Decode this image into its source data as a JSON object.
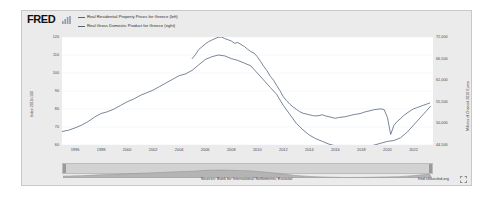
{
  "brand": {
    "logo_text": "FRED",
    "spark_icon": "sparkline-icon"
  },
  "legend": {
    "items": [
      {
        "label": "Real Residential Property Prices for Greece (left)",
        "color": "#5b6b84",
        "swatch_icon": "legend-line-swatch"
      },
      {
        "label": "Real Gross Domestic Product for Greece (right)",
        "color": "#5b6b84",
        "swatch_icon": "legend-line-swatch"
      }
    ]
  },
  "footer": {
    "source_note": "Sources: Bank for International Settlements; Eurostat",
    "url": "fred.stlouisfed.org",
    "expand_icon": "fullscreen-expand-icon"
  },
  "navigator": {
    "name": "date-range-navigator",
    "left_handle_icon": "range-handle-left-icon",
    "right_handle_icon": "range-handle-right-icon"
  },
  "chart_data": {
    "type": "line",
    "title": "",
    "xlabel": "",
    "grid": true,
    "legend_position": "top",
    "x_ticks": [
      "1996",
      "1998",
      "2000",
      "2002",
      "2004",
      "2006",
      "2008",
      "2010",
      "2012",
      "2014",
      "2016",
      "2018",
      "2020",
      "2022"
    ],
    "xlim": [
      1995.0,
      2023.5
    ],
    "axes": [
      {
        "id": "left",
        "ylabel": "Index 2010=100",
        "ylim": [
          60,
          120
        ],
        "ticks": [
          120,
          110,
          100,
          90,
          80,
          70,
          60
        ],
        "tick_labels": [
          "120",
          "110",
          "100",
          "90",
          "80",
          "70",
          "60"
        ]
      },
      {
        "id": "right",
        "ylabel": "Millions of Chained 2010 Euros",
        "ylim": [
          44500,
          72000
        ],
        "ticks": [
          72000,
          66500,
          61000,
          55500,
          50000,
          44500
        ],
        "tick_labels": [
          "72,000",
          "66,500",
          "61,000",
          "55,500",
          "50,000",
          "44,500"
        ]
      }
    ],
    "series": [
      {
        "name": "Real Residential Property Prices for Greece",
        "axis": "left",
        "color": "#58667d",
        "x": [
          1995.0,
          1995.5,
          1996.0,
          1996.5,
          1997.0,
          1997.5,
          1998.0,
          1998.5,
          1999.0,
          1999.5,
          2000.0,
          2000.5,
          2001.0,
          2001.5,
          2002.0,
          2002.5,
          2003.0,
          2003.5,
          2004.0,
          2004.5,
          2005.0,
          2005.5,
          2006.0,
          2006.5,
          2007.0,
          2007.5,
          2008.0,
          2008.5,
          2009.0,
          2009.5,
          2010.0,
          2010.5,
          2011.0,
          2011.5,
          2012.0,
          2012.5,
          2013.0,
          2013.5,
          2014.0,
          2014.5,
          2015.0,
          2015.5,
          2016.0,
          2016.5,
          2017.0,
          2017.5,
          2018.0,
          2018.5,
          2019.0,
          2019.5,
          2020.0,
          2020.5,
          2021.0,
          2021.5,
          2022.0,
          2022.5,
          2023.0,
          2023.3
        ],
        "y": [
          67.5,
          68.2,
          69.5,
          71.0,
          73.0,
          75.5,
          77.5,
          78.5,
          80.0,
          82.0,
          84.0,
          85.5,
          87.5,
          89.0,
          90.5,
          92.5,
          94.5,
          96.5,
          98.5,
          99.5,
          101.5,
          104.5,
          107.5,
          109.0,
          110.0,
          109.5,
          108.0,
          107.0,
          105.5,
          104.0,
          100.0,
          96.0,
          92.0,
          88.0,
          82.0,
          77.0,
          72.0,
          68.5,
          65.5,
          63.5,
          62.0,
          60.5,
          59.5,
          58.5,
          58.0,
          58.2,
          58.5,
          59.0,
          60.0,
          61.0,
          62.0,
          62.5,
          64.0,
          67.0,
          71.0,
          75.0,
          79.0,
          81.5
        ]
      },
      {
        "name": "Real Gross Domestic Product for Greece",
        "axis": "right",
        "color": "#58667d",
        "x": [
          2005.0,
          2005.25,
          2005.5,
          2005.75,
          2006.0,
          2006.25,
          2006.5,
          2006.75,
          2007.0,
          2007.25,
          2007.5,
          2007.75,
          2008.0,
          2008.25,
          2008.5,
          2008.75,
          2009.0,
          2009.25,
          2009.5,
          2009.75,
          2010.0,
          2010.25,
          2010.5,
          2010.75,
          2011.0,
          2011.25,
          2011.5,
          2011.75,
          2012.0,
          2012.25,
          2012.5,
          2012.75,
          2013.0,
          2013.25,
          2013.5,
          2013.75,
          2014.0,
          2014.25,
          2014.5,
          2014.75,
          2015.0,
          2015.25,
          2015.5,
          2015.75,
          2016.0,
          2016.25,
          2016.5,
          2016.75,
          2017.0,
          2017.25,
          2017.5,
          2017.75,
          2018.0,
          2018.25,
          2018.5,
          2018.75,
          2019.0,
          2019.25,
          2019.5,
          2019.75,
          2020.0,
          2020.25,
          2020.5,
          2020.75,
          2021.0,
          2021.25,
          2021.5,
          2021.75,
          2022.0,
          2022.25,
          2022.5,
          2022.75,
          2023.0,
          2023.25
        ],
        "y": [
          66500,
          67500,
          68800,
          69500,
          70200,
          70800,
          71200,
          71600,
          71900,
          72000,
          71600,
          71300,
          71000,
          70400,
          70600,
          70100,
          69600,
          68900,
          68300,
          67900,
          67000,
          65800,
          64500,
          63400,
          62000,
          61000,
          59600,
          58300,
          56800,
          55800,
          54900,
          54200,
          53600,
          53000,
          52600,
          52400,
          52200,
          52000,
          51900,
          52000,
          52200,
          51900,
          51700,
          51500,
          51300,
          51500,
          51600,
          51700,
          51900,
          52100,
          52300,
          52400,
          52600,
          52900,
          53100,
          53300,
          53500,
          53600,
          53700,
          53500,
          51500,
          47200,
          49500,
          50500,
          51200,
          52000,
          52600,
          53200,
          53700,
          54000,
          54300,
          54600,
          54900,
          55200
        ]
      }
    ]
  }
}
